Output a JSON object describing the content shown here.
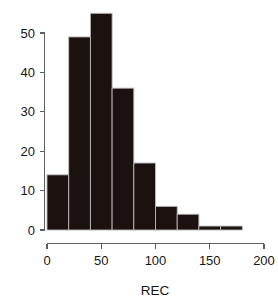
{
  "chart_data": {
    "type": "bar",
    "title": "",
    "subtitle": "",
    "xlabel": "REC",
    "ylabel": "",
    "grid": false,
    "legend": null,
    "xlim": [
      0,
      200
    ],
    "ylim": [
      0,
      55
    ],
    "xticks": [
      0,
      50,
      100,
      150,
      200
    ],
    "yticks": [
      0,
      10,
      20,
      30,
      40,
      50
    ],
    "xtick_labels": [
      "0",
      "50",
      "100",
      "150",
      "200"
    ],
    "ytick_labels": [
      "0",
      "10",
      "20",
      "30",
      "40",
      "50"
    ],
    "bin_width": 20,
    "bin_edges": [
      0,
      20,
      40,
      60,
      80,
      100,
      120,
      140,
      160,
      180
    ],
    "categories": [
      "0-20",
      "20-40",
      "40-60",
      "60-80",
      "80-100",
      "100-120",
      "120-140",
      "140-160",
      "160-180"
    ],
    "values": [
      14,
      49,
      55,
      36,
      17,
      6,
      4,
      1,
      1
    ],
    "bar_color": "#1b1210",
    "bar_edge_color": "#b9b9b9",
    "axis_color": "#5e5e5e"
  },
  "axis": {
    "x_title": "REC",
    "y_title": ""
  }
}
